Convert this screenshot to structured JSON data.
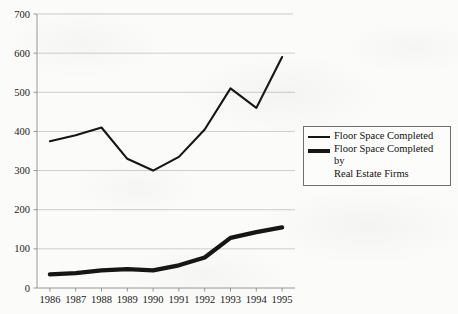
{
  "chart_data": {
    "type": "line",
    "title": "",
    "subtitle": "",
    "xlabel": "",
    "ylabel": "",
    "categories": [
      "1986",
      "1987",
      "1988",
      "1989",
      "1990",
      "1991",
      "1992",
      "1993",
      "1994",
      "1995"
    ],
    "x": [
      1986,
      1987,
      1988,
      1989,
      1990,
      1991,
      1992,
      1993,
      1994,
      1995
    ],
    "series": [
      {
        "name": "Floor Space Completed",
        "style": "thin",
        "values": [
          375,
          390,
          410,
          330,
          300,
          335,
          405,
          510,
          460,
          590
        ]
      },
      {
        "name": "Floor Space Completed by Real Estate Firms",
        "style": "thick",
        "values": [
          35,
          38,
          45,
          48,
          45,
          58,
          78,
          128,
          143,
          155
        ]
      }
    ],
    "ylim": [
      0,
      700
    ],
    "yticks": [
      0,
      100,
      200,
      300,
      400,
      500,
      600,
      700
    ],
    "ytick_labels": [
      "0",
      "100",
      "200",
      "300",
      "400",
      "500",
      "600",
      "700"
    ],
    "grid": true,
    "grid_axis": "y",
    "legend_position": "right",
    "colors": {
      "series_line": "#151515",
      "gridline": "#b9b9b9",
      "axis": "#8c8c8c",
      "background": "#fbfbf9",
      "legend_border": "#6f6f6f"
    }
  },
  "legend": {
    "entries": [
      {
        "label": "Floor Space Completed",
        "swatch": "thin-line-swatch"
      },
      {
        "label_line1": "Floor Space Completed by",
        "label_line2": "Real Estate Firms",
        "swatch": "thick-line-swatch"
      }
    ]
  }
}
